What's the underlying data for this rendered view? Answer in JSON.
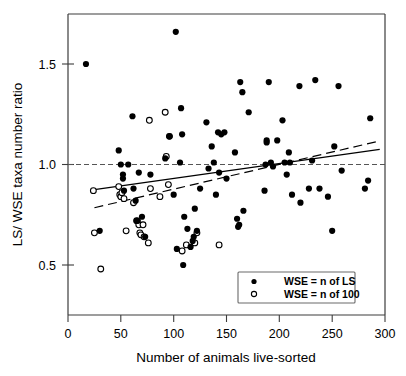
{
  "chart_data": {
    "type": "scatter",
    "title": "",
    "xlabel": "Number of animals live-sorted",
    "ylabel": "LS/ WSE taxa number ratio",
    "xlim": [
      0,
      300
    ],
    "ylim": [
      0.3,
      1.78
    ],
    "xticks": [
      0,
      50,
      100,
      150,
      200,
      250,
      300
    ],
    "xtick_labels": [
      "0",
      "50",
      "100",
      "150",
      "200",
      "250",
      "300"
    ],
    "yticks": [
      0.5,
      1.0,
      1.5
    ],
    "ytick_labels": [
      "0.5",
      "1.0",
      "1.5"
    ],
    "grid": false,
    "legend_position": "lower-right",
    "reference_line": {
      "type": "horizontal-dashed",
      "y": 1.0,
      "label": "ratio = 1.0"
    },
    "legend": [
      {
        "key": "wse_n_of_ls",
        "label": "WSE = n of LS",
        "marker": "filled-circle"
      },
      {
        "key": "wse_n_of_100",
        "label": "WSE = n of 100",
        "marker": "open-circle"
      }
    ],
    "series": [
      {
        "name": "WSE = n of LS",
        "marker": "filled-circle",
        "points": [
          [
            17,
            1.5
          ],
          [
            30,
            0.67
          ],
          [
            48,
            1.07
          ],
          [
            50,
            1.0
          ],
          [
            52,
            0.95
          ],
          [
            52,
            0.93
          ],
          [
            53,
            0.87
          ],
          [
            57,
            1.0
          ],
          [
            61,
            1.24
          ],
          [
            62,
            0.88
          ],
          [
            64,
            0.82
          ],
          [
            65,
            0.72
          ],
          [
            66,
            0.72
          ],
          [
            67,
            0.96
          ],
          [
            70,
            0.74
          ],
          [
            73,
            0.64
          ],
          [
            78,
            0.95
          ],
          [
            92,
            1.03
          ],
          [
            96,
            1.14
          ],
          [
            100,
            0.85
          ],
          [
            102,
            1.66
          ],
          [
            103,
            0.58
          ],
          [
            106,
            1.01
          ],
          [
            107,
            1.28
          ],
          [
            108,
            1.15
          ],
          [
            109,
            0.5
          ],
          [
            110,
            0.74
          ],
          [
            113,
            0.68
          ],
          [
            116,
            0.59
          ],
          [
            118,
            0.62
          ],
          [
            119,
            0.64
          ],
          [
            120,
            0.78
          ],
          [
            122,
            0.67
          ],
          [
            125,
            0.88
          ],
          [
            131,
            1.21
          ],
          [
            133,
            0.98
          ],
          [
            136,
            1.09
          ],
          [
            138,
            1.01
          ],
          [
            140,
            0.85
          ],
          [
            142,
            1.16
          ],
          [
            143,
            0.96
          ],
          [
            145,
            1.15
          ],
          [
            148,
            1.16
          ],
          [
            150,
            0.93
          ],
          [
            158,
            1.06
          ],
          [
            160,
            0.73
          ],
          [
            161,
            0.69
          ],
          [
            162,
            0.7
          ],
          [
            163,
            1.41
          ],
          [
            165,
            1.36
          ],
          [
            166,
            0.77
          ],
          [
            171,
            1.26
          ],
          [
            186,
            0.87
          ],
          [
            187,
            1.0
          ],
          [
            188,
            1.12
          ],
          [
            188,
            1.11
          ],
          [
            190,
            1.41
          ],
          [
            192,
            1.01
          ],
          [
            194,
            0.99
          ],
          [
            198,
            1.12
          ],
          [
            203,
            1.22
          ],
          [
            205,
            1.01
          ],
          [
            207,
            0.95
          ],
          [
            209,
            1.06
          ],
          [
            210,
            1.01
          ],
          [
            212,
            0.85
          ],
          [
            219,
            1.39
          ],
          [
            220,
            0.81
          ],
          [
            228,
            0.88
          ],
          [
            231,
            1.02
          ],
          [
            234,
            1.42
          ],
          [
            238,
            0.88
          ],
          [
            246,
            0.84
          ],
          [
            250,
            0.67
          ],
          [
            252,
            1.09
          ],
          [
            256,
            1.39
          ],
          [
            259,
            0.97
          ],
          [
            281,
            0.88
          ],
          [
            284,
            0.92
          ],
          [
            286,
            1.23
          ]
        ]
      },
      {
        "name": "WSE = n of 100",
        "marker": "open-circle",
        "points": [
          [
            24,
            0.87
          ],
          [
            25,
            0.66
          ],
          [
            31,
            0.48
          ],
          [
            48,
            0.89
          ],
          [
            49,
            0.85
          ],
          [
            50,
            0.84
          ],
          [
            51,
            0.86
          ],
          [
            53,
            0.83
          ],
          [
            55,
            0.67
          ],
          [
            62,
            0.81
          ],
          [
            65,
            0.72
          ],
          [
            67,
            0.7
          ],
          [
            68,
            0.66
          ],
          [
            69,
            0.65
          ],
          [
            71,
            0.7
          ],
          [
            72,
            0.64
          ],
          [
            76,
            0.61
          ],
          [
            77,
            1.22
          ],
          [
            78,
            0.88
          ],
          [
            87,
            0.84
          ],
          [
            92,
            1.26
          ],
          [
            93,
            1.04
          ],
          [
            95,
            0.9
          ],
          [
            96,
            1.14
          ],
          [
            108,
            0.57
          ],
          [
            112,
            0.6
          ],
          [
            120,
            0.61
          ],
          [
            122,
            0.66
          ],
          [
            143,
            0.6
          ]
        ]
      }
    ],
    "fit_lines": [
      {
        "name": "solid-regression",
        "style": "solid",
        "x_start": 25,
        "y_start": 0.875,
        "x_end": 295,
        "y_end": 1.075
      },
      {
        "name": "dashed-regression",
        "style": "long-dashed",
        "x_start": 25,
        "y_start": 0.785,
        "x_end": 293,
        "y_end": 1.115
      }
    ]
  }
}
